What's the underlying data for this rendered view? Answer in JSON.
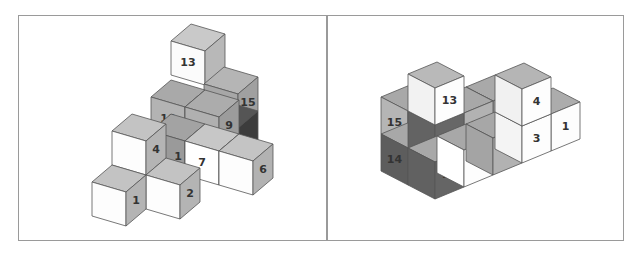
{
  "figure": {
    "panels": [
      {
        "name": "left-view",
        "projection": {
          "front": [
            34,
            10
          ],
          "depth": [
            20,
            -17
          ],
          "height": 34
        },
        "cubes": [
          {
            "id": "13",
            "pos": [
              171,
              41
            ],
            "faces": {
              "front": "#fbfbfb",
              "side": "#b8b8b8",
              "top": "#c9c9c9"
            },
            "label_face": "front"
          },
          {
            "id": "15",
            "pos": [
              204,
              84
            ],
            "faces": {
              "front": "#a7a7a7",
              "side": "#a0a0a0",
              "top": "#b5b5b5"
            },
            "label_face": "side"
          },
          {
            "id": "hidden-dark",
            "pos": [
              204,
              118
            ],
            "faces": {
              "front": "#4a4a4a",
              "side": "#3c3c3c",
              "top": "#555555"
            },
            "label_face": "none"
          },
          {
            "id": "10",
            "pos": [
              151,
              97
            ],
            "faces": {
              "front": "#b3b3b3",
              "side": "#a5a5a5",
              "top": "#a9a9a9"
            },
            "label_face": "front"
          },
          {
            "id": "9",
            "pos": [
              185,
              107
            ],
            "faces": {
              "front": "#b0b0b0",
              "side": "#9c9c9c",
              "top": "#acacac"
            },
            "label_face": "side"
          },
          {
            "id": "hidden-shadow",
            "pos": [
              151,
              131
            ],
            "faces": {
              "front": "#9a9a9a",
              "side": "#8c8c8c",
              "top": "#a3a3a3"
            },
            "label_face": "none"
          },
          {
            "id": "7",
            "pos": [
              185,
              141
            ],
            "faces": {
              "front": "#ffffff",
              "side": "#d0d0d0",
              "top": "#c7c7c7"
            },
            "label_face": "front"
          },
          {
            "id": "6",
            "pos": [
              219,
              151
            ],
            "faces": {
              "front": "#fdfdfd",
              "side": "#b2b2b2",
              "top": "#c4c4c4"
            },
            "label_face": "side"
          },
          {
            "id": "4",
            "pos": [
              112,
              131
            ],
            "faces": {
              "front": "#fdfdfd",
              "side": "#b4b4b4",
              "top": "#c3c3c3"
            },
            "label_face": "side"
          },
          {
            "id": "2",
            "pos": [
              146,
              175
            ],
            "faces": {
              "front": "#fdfdfd",
              "side": "#b4b4b4",
              "top": "#c3c3c3"
            },
            "label_face": "side"
          },
          {
            "id": "1",
            "pos": [
              92,
              182
            ],
            "faces": {
              "front": "#fdfdfd",
              "side": "#b4b4b4",
              "top": "#c3c3c3"
            },
            "label_face": "side"
          }
        ],
        "extra_labels": [
          {
            "text": "1",
            "x": 178,
            "y": 157,
            "note": "partially hidden label"
          }
        ]
      },
      {
        "name": "right-view",
        "projection": {
          "right": [
            29,
            -12
          ],
          "left": [
            -27,
            -14
          ],
          "height": 37
        },
        "cubes": [
          {
            "id": "back-top",
            "pos": [
              493,
              101
            ],
            "faces": {
              "left": "#a3a3a3",
              "right": "#a3a3a3",
              "top": "#a9a9a9"
            },
            "label_face": "none"
          },
          {
            "id": "15",
            "pos": [
              408,
              111
            ],
            "faces": {
              "left": "#b5b5b5",
              "right": "#6a6a6a",
              "top": "#a8a8a8"
            },
            "label_face": "left"
          },
          {
            "id": "14",
            "pos": [
              408,
              148
            ],
            "faces": {
              "left": "#5d5d5d",
              "right": "#606060",
              "top": "#a8a8a8"
            },
            "label_face": "left"
          },
          {
            "id": "10",
            "pos": [
              464,
              113
            ],
            "faces": {
              "left": "#6a6a6a",
              "right": "#b2b2b2",
              "top": "#a8a8a8"
            },
            "label_face": "right"
          },
          {
            "id": "12",
            "pos": [
              435,
              125
            ],
            "faces": {
              "left": "#636363",
              "right": "#676767",
              "top": "#a8a8a8"
            },
            "label_face": "right"
          },
          {
            "id": "11",
            "pos": [
              435,
              162
            ],
            "faces": {
              "left": "#616161",
              "right": "#656565",
              "top": "#a8a8a8"
            },
            "label_face": "right"
          },
          {
            "id": "13",
            "pos": [
              435,
              88
            ],
            "faces": {
              "left": "#f2f2f2",
              "right": "#fdfdfd",
              "top": "#b9b9b9"
            },
            "label_face": "right"
          },
          {
            "id": "8",
            "pos": [
              464,
              150
            ],
            "faces": {
              "left": "#ffffff",
              "right": "#fdfdfd",
              "top": "#a8a8a8"
            },
            "label_face": "right"
          },
          {
            "id": "5",
            "pos": [
              493,
              138
            ],
            "faces": {
              "left": "#a4a4a4",
              "right": "#b2b2b2",
              "top": "#a7a7a7"
            },
            "label_face": "right"
          },
          {
            "id": "1",
            "pos": [
              551,
              114
            ],
            "faces": {
              "left": "#f4f4f4",
              "right": "#fdfdfd",
              "top": "#acacac"
            },
            "label_face": "right"
          },
          {
            "id": "3",
            "pos": [
              522,
              126
            ],
            "faces": {
              "left": "#f4f4f4",
              "right": "#fdfdfd",
              "top": "#acacac"
            },
            "label_face": "right"
          },
          {
            "id": "4",
            "pos": [
              522,
              89
            ],
            "faces": {
              "left": "#f1f1f1",
              "right": "#fdfdfd",
              "top": "#b5b5b5"
            },
            "label_face": "right"
          }
        ]
      }
    ],
    "stroke_color": "#555555",
    "border_color": "#9a9a9a"
  }
}
